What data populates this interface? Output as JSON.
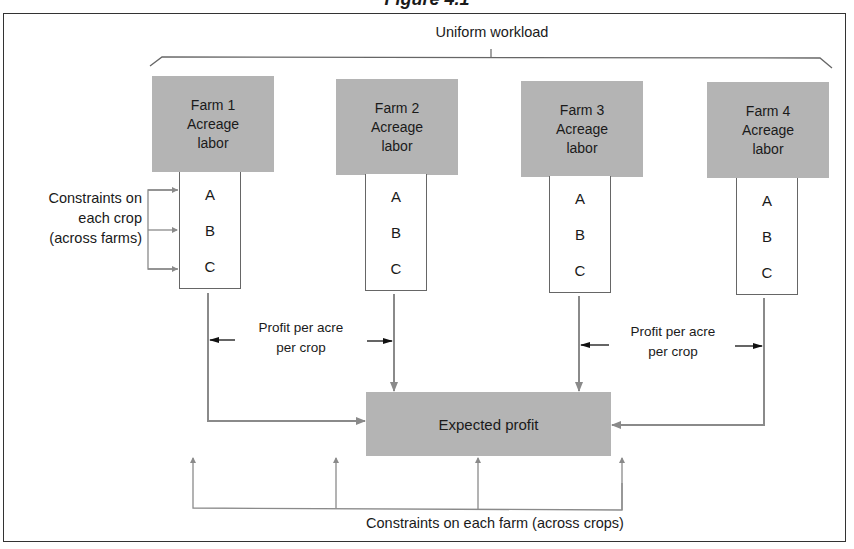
{
  "figure_title": "Figure 4.1",
  "top_brace_label": "Uniform workload",
  "farms": [
    {
      "name": "Farm 1",
      "line2": "Acreage",
      "line3": "labor",
      "crops": [
        "A",
        "B",
        "C"
      ]
    },
    {
      "name": "Farm 2",
      "line2": "Acreage",
      "line3": "labor",
      "crops": [
        "A",
        "B",
        "C"
      ]
    },
    {
      "name": "Farm 3",
      "line2": "Acreage",
      "line3": "labor",
      "crops": [
        "A",
        "B",
        "C"
      ]
    },
    {
      "name": "Farm 4",
      "line2": "Acreage",
      "line3": "labor",
      "crops": [
        "A",
        "B",
        "C"
      ]
    }
  ],
  "left_label": {
    "line1": "Constraints on",
    "line2": "each crop",
    "line3": "(across farms)"
  },
  "profit_label_left": {
    "line1": "Profit per acre",
    "line2": "per crop"
  },
  "profit_label_right": {
    "line1": "Profit per acre",
    "line2": "per crop"
  },
  "center_box": "Expected profit",
  "bottom_label": "Constraints on each farm (across crops)",
  "colors": {
    "box_fill": "#b4b4b4",
    "line": "#888888",
    "text": "#1a1a1a"
  }
}
